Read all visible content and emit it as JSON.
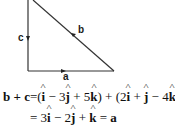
{
  "figure": {
    "type": "vector-triangle",
    "labels": {
      "a": "a",
      "b": "b",
      "c": "c"
    },
    "line_color": "#333333"
  },
  "equations": {
    "line1": {
      "lhs": "b + c",
      "eq": "=",
      "term1": [
        "(",
        "î",
        " − 3",
        "ĵ",
        " + 5",
        "k̂",
        ")"
      ],
      "plus": " + ",
      "term2": [
        "(2",
        "î",
        " + ",
        "ĵ",
        " − 4",
        "k̂",
        ")"
      ]
    },
    "line2": {
      "eq": "=",
      "rhs_prefix": " 3",
      "i": "i",
      "mid1": " − 2",
      "j": "j",
      "mid2": " + ",
      "k": "k",
      "eq2": " = ",
      "result": "a"
    }
  }
}
